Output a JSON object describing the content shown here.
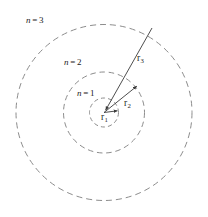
{
  "figure": {
    "background_color": "#ffffff",
    "width": 208,
    "height": 217
  },
  "style": {
    "orbit_stroke": "#8c8c8c",
    "orbit_dash": "6 4",
    "orbit_width": 1,
    "radius_stroke": "#3a3a3a",
    "radius_width": 0.9,
    "text_color": "#1b1b1b"
  },
  "nucleus": {
    "center_x": 104,
    "center_y": 112.5
  },
  "shells": [
    {
      "id": "shell-n1",
      "label_var": "n",
      "label_eq": "=",
      "label_num": "1",
      "quantum_number": 1,
      "radius_px": 14.5
    },
    {
      "id": "shell-n2",
      "label_var": "n",
      "label_eq": "=",
      "label_num": "2",
      "quantum_number": 2,
      "radius_px": 40.5
    },
    {
      "id": "shell-n3",
      "label_var": "n",
      "label_eq": "=",
      "label_num": "3",
      "quantum_number": 3,
      "radius_px": 88
    }
  ],
  "radii": [
    {
      "id": "radius-r1",
      "label_var": "r",
      "label_sub": "1",
      "x1": 104,
      "y1": 112.5,
      "x2": 118,
      "y2": 110.5
    },
    {
      "id": "radius-r2",
      "label_var": "r",
      "label_sub": "2",
      "x1": 104,
      "y1": 112.5,
      "x2": 137.5,
      "y2": 85.5
    },
    {
      "id": "radius-r3",
      "label_var": "r",
      "label_sub": "3",
      "x1": 104,
      "y1": 112.5,
      "x2": 152,
      "y2": 28
    }
  ],
  "chart_data": {
    "type": "diagram",
    "center": [
      104,
      112.5
    ],
    "categories": [
      "n = 1",
      "n = 2",
      "n = 3"
    ],
    "values": [
      14.5,
      40.5,
      88
    ],
    "ylabel": "shell radius (px)",
    "annotations": [
      "n = 3",
      "n = 2",
      "n = 1",
      "r₃",
      "r₂",
      "r₁"
    ],
    "legend": "none",
    "grid": false
  }
}
